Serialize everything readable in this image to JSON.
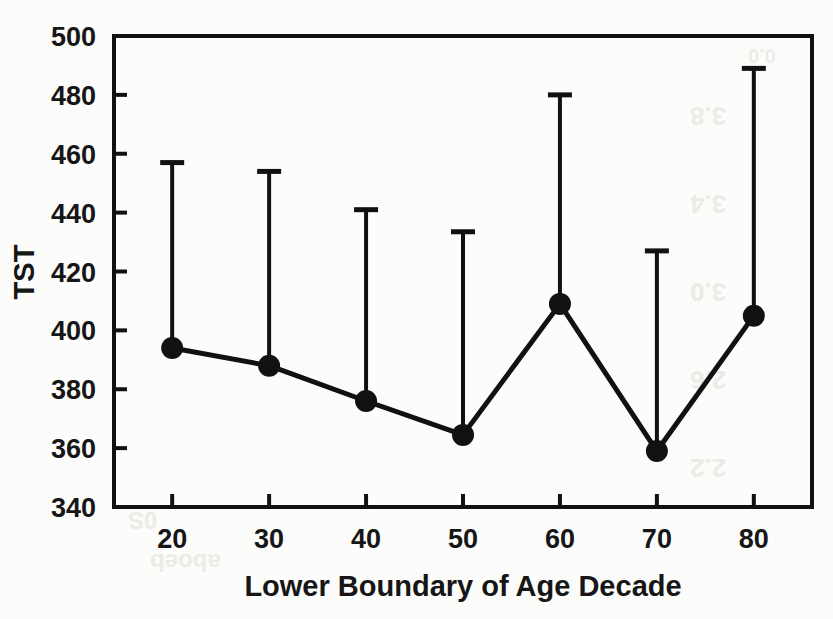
{
  "chart_data": {
    "type": "line",
    "title": "",
    "xlabel": "Lower Boundary of Age Decade",
    "ylabel": "TST",
    "x": [
      20,
      30,
      40,
      50,
      60,
      70,
      80
    ],
    "xticklabels": [
      "20",
      "30",
      "40",
      "50",
      "60",
      "70",
      "80"
    ],
    "yticklabels": [
      "340",
      "360",
      "380",
      "400",
      "420",
      "440",
      "460",
      "480",
      "500"
    ],
    "yticks": [
      340,
      360,
      380,
      400,
      420,
      440,
      460,
      480,
      500
    ],
    "xlim": [
      14,
      86
    ],
    "ylim": [
      340,
      500
    ],
    "grid": false,
    "legend": null,
    "series": [
      {
        "name": "TST",
        "marker": "filled-circle",
        "values": [
          394,
          388,
          376,
          364.5,
          409,
          359,
          405
        ],
        "error_upper": [
          457,
          454,
          441,
          433.5,
          480,
          427,
          489
        ],
        "error_lower": null,
        "errorbar_style": "upper-only-with-cap"
      }
    ],
    "colors": {
      "line": "#111111",
      "marker": "#111111",
      "errorbar": "#111111",
      "axis": "#111111",
      "background": "#fcfcfb"
    }
  },
  "axes": {
    "y_axis_label": "TST",
    "x_axis_label": "Lower Boundary of Age Decade"
  },
  "bleedthrough": {
    "items": [
      "0.0",
      "3.8",
      "3.4",
      "3.0",
      "2.6",
      "2.2",
      "0S",
      "aboeb"
    ]
  }
}
